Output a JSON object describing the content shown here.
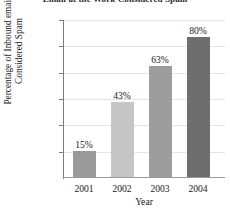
{
  "chart_data": {
    "type": "bar",
    "title": "Email at the Work Considered Spam",
    "title_cropped": true,
    "xlabel": "Year",
    "ylabel": "Percentage of Inbound email Considered Spam",
    "ylabel_line1": "Percentage of Inbound email",
    "ylabel_line2": "Considered Spam",
    "categories": [
      "2001",
      "2002",
      "2003",
      "2004"
    ],
    "values": [
      15,
      43,
      63,
      80
    ],
    "value_labels": [
      "15%",
      "43%",
      "63%",
      "80%"
    ],
    "ylim": [
      0,
      90
    ],
    "yticks": [
      15,
      30,
      45,
      60,
      75,
      90
    ],
    "ytick_labels": [
      "15%",
      "30%",
      "45%",
      "60%",
      "75%",
      "90%"
    ],
    "grid": true,
    "legend": false,
    "bar_colors": [
      "#9a9a9a",
      "#c6c6c6",
      "#9d9d9d",
      "#6e6e6e"
    ],
    "axis_color": "#7d7d7d",
    "gridline_color": "#e4e4e4",
    "background": "#ffffff"
  }
}
